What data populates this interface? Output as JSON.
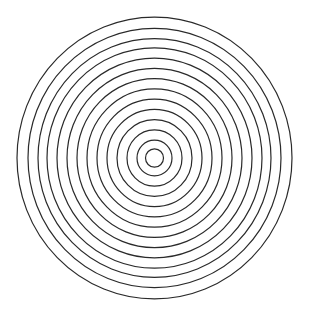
{
  "diagram": {
    "type": "concentric-rings",
    "background": "#ffffff",
    "stroke_color": "#2a2a2a",
    "stroke_width": 1.2,
    "center": {
      "x": 154.5,
      "y": 158
    },
    "aspect_y": 1.025,
    "ring_count": 14,
    "radii": [
      137.5,
      126.5,
      116.5,
      107.5,
      97.5,
      87.5,
      77.5,
      67.5,
      57.5,
      47.5,
      37.5,
      27.5,
      17.5,
      9
    ]
  }
}
